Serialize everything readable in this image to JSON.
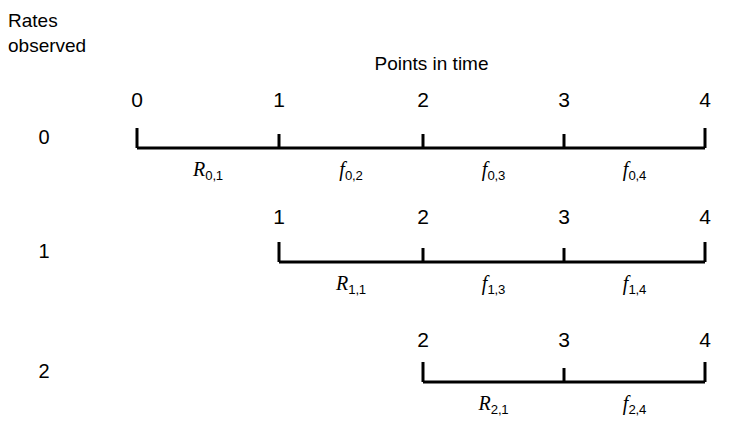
{
  "caption": {
    "line1": "Rates",
    "line2": "observed"
  },
  "chart_title": "Points in time",
  "axis_color": "#000000",
  "background_color": "#ffffff",
  "chart_data": {
    "type": "diagram",
    "title": "Points in time",
    "ylabel": "Rates observed",
    "xlabel": "Points in time",
    "x_ticks": [
      0,
      1,
      2,
      3,
      4
    ],
    "rows": [
      {
        "row_label": "0",
        "tick_labels": [
          "0",
          "1",
          "2",
          "3",
          "4"
        ],
        "tick_values": [
          0,
          1,
          2,
          3,
          4
        ],
        "segments": [
          {
            "symbol": "R",
            "sub": "0,1"
          },
          {
            "symbol": "f",
            "sub": "0,2"
          },
          {
            "symbol": "f",
            "sub": "0,3"
          },
          {
            "symbol": "f",
            "sub": "0,4"
          }
        ]
      },
      {
        "row_label": "1",
        "tick_labels": [
          "1",
          "2",
          "3",
          "4"
        ],
        "tick_values": [
          1,
          2,
          3,
          4
        ],
        "segments": [
          {
            "symbol": "R",
            "sub": "1,1"
          },
          {
            "symbol": "f",
            "sub": "1,3"
          },
          {
            "symbol": "f",
            "sub": "1,4"
          }
        ]
      },
      {
        "row_label": "2",
        "tick_labels": [
          "2",
          "3",
          "4"
        ],
        "tick_values": [
          2,
          3,
          4
        ],
        "segments": [
          {
            "symbol": "R",
            "sub": "2,1"
          },
          {
            "symbol": "f",
            "sub": "2,4"
          }
        ]
      }
    ],
    "geometry": {
      "x_positions": {
        "0": 137,
        "1": 279,
        "2": 423,
        "3": 564,
        "4": 705
      },
      "row_baselines": [
        148,
        262,
        382
      ],
      "tick_label_y": [
        88,
        205,
        328
      ],
      "seg_label_y": [
        158,
        272,
        392
      ],
      "row_label_x": 30,
      "end_tick_height": 20,
      "mid_tick_height": 14
    }
  }
}
